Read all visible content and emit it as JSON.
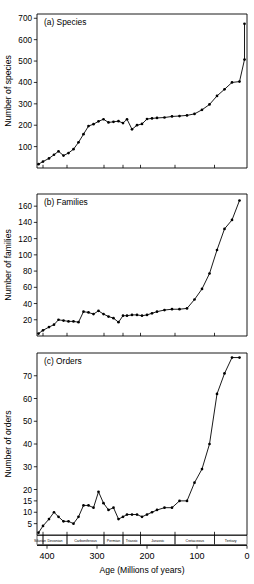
{
  "figure": {
    "xlabel": "Age (Millions of years)",
    "x_ticks": [
      400,
      300,
      200,
      100,
      0
    ],
    "x_range": [
      420,
      0
    ],
    "periods": [
      {
        "name": "Silurian",
        "start": 420,
        "end": 408
      },
      {
        "name": "Devonian",
        "start": 408,
        "end": 360
      },
      {
        "name": "Carboniferous",
        "start": 360,
        "end": 286
      },
      {
        "name": "Permian",
        "start": 286,
        "end": 248
      },
      {
        "name": "Triassic",
        "start": 248,
        "end": 213
      },
      {
        "name": "Jurassic",
        "start": 213,
        "end": 144
      },
      {
        "name": "Cretaceous",
        "start": 144,
        "end": 65
      },
      {
        "name": "Tertiary",
        "start": 65,
        "end": 0
      }
    ]
  },
  "chart_data": [
    {
      "type": "line",
      "panel": "a",
      "title": "(a) Species",
      "xlabel": "Age (Millions of years)",
      "ylabel": "Number of species",
      "xlim": [
        420,
        0
      ],
      "ylim": [
        0,
        720
      ],
      "y_ticks": [
        100,
        200,
        300,
        400,
        500,
        600,
        700
      ],
      "grid": false,
      "legend": "none",
      "x": [
        417,
        408,
        396,
        386,
        377,
        367,
        357,
        347,
        337,
        327,
        317,
        307,
        297,
        287,
        277,
        267,
        257,
        248,
        240,
        230,
        220,
        210,
        200,
        190,
        180,
        165,
        150,
        135,
        120,
        105,
        90,
        75,
        60,
        45,
        30,
        15,
        5
      ],
      "values": [
        18,
        30,
        45,
        62,
        78,
        58,
        70,
        88,
        120,
        158,
        196,
        205,
        218,
        228,
        213,
        216,
        219,
        210,
        228,
        181,
        200,
        206,
        229,
        232,
        234,
        236,
        241,
        243,
        246,
        253,
        272,
        297,
        337,
        368,
        400,
        404,
        507,
        674
      ]
    },
    {
      "type": "line",
      "panel": "b",
      "title": "(b) Families",
      "xlabel": "Age (Millions of years)",
      "ylabel": "Number of families",
      "xlim": [
        420,
        0
      ],
      "ylim": [
        0,
        175
      ],
      "y_ticks": [
        20,
        40,
        60,
        80,
        100,
        120,
        140,
        160
      ],
      "grid": false,
      "legend": "none",
      "x": [
        417,
        408,
        396,
        386,
        377,
        367,
        357,
        347,
        337,
        327,
        317,
        307,
        297,
        287,
        277,
        267,
        257,
        248,
        240,
        230,
        220,
        210,
        200,
        190,
        180,
        165,
        150,
        135,
        120,
        105,
        90,
        75,
        60,
        45,
        30,
        15,
        5
      ],
      "values": [
        3,
        7,
        11,
        14,
        20,
        19,
        18,
        18,
        17,
        30,
        29,
        27,
        31,
        27,
        24,
        22,
        17,
        25,
        25,
        26,
        26,
        25,
        26,
        28,
        30,
        32,
        33,
        33,
        34,
        45,
        58,
        77,
        106,
        132,
        143,
        167
      ]
    },
    {
      "type": "line",
      "panel": "c",
      "title": "(c) Orders",
      "xlabel": "Age (Millions of years)",
      "ylabel": "Number of orders",
      "xlim": [
        420,
        0
      ],
      "ylim": [
        0,
        80
      ],
      "y_ticks": [
        5,
        10,
        15,
        20,
        30,
        40,
        50,
        60,
        70
      ],
      "grid": false,
      "legend": "none",
      "x": [
        417,
        408,
        396,
        386,
        377,
        367,
        357,
        347,
        337,
        327,
        317,
        307,
        297,
        287,
        277,
        267,
        257,
        248,
        240,
        230,
        220,
        210,
        200,
        190,
        180,
        165,
        150,
        135,
        120,
        105,
        90,
        75,
        60,
        45,
        30,
        15,
        5
      ],
      "values": [
        1,
        4,
        7,
        10,
        8,
        6,
        6,
        5,
        8,
        13,
        13,
        12,
        19,
        14,
        11,
        12,
        7,
        8,
        9,
        9,
        9,
        8,
        9,
        10,
        11,
        12,
        12,
        15,
        15,
        23,
        29,
        40,
        62,
        71,
        78,
        78
      ]
    }
  ]
}
